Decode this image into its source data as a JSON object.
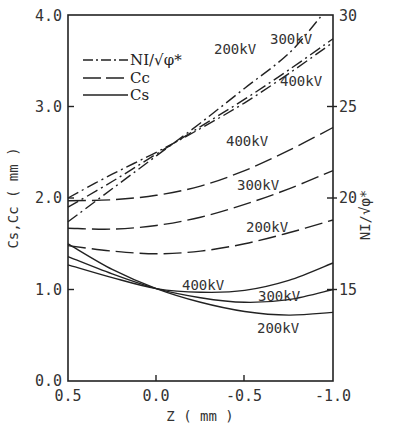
{
  "chart_data": {
    "type": "line",
    "title": "",
    "xlabel": "Z ( mm )",
    "ylabel": "Cs,Cc ( mm )",
    "ylabel_right": "NI/√φ*",
    "xlim": [
      0.5,
      -1.0
    ],
    "ylim": [
      0.0,
      4.0
    ],
    "ylim_right": [
      10,
      30
    ],
    "x_ticks": [
      "0.5",
      "0.0",
      "-0.5",
      "-1.0"
    ],
    "y_ticks": [
      "0.0",
      "1.0",
      "2.0",
      "3.0",
      "4.0"
    ],
    "y_ticks_right": [
      "15",
      "20",
      "25",
      "30"
    ],
    "grid": false,
    "legend": {
      "position": "upper-left",
      "entries": [
        {
          "label": "NI/√φ*",
          "style": "dash-dot"
        },
        {
          "label": "Cc",
          "style": "dashed"
        },
        {
          "label": "Cs",
          "style": "solid"
        }
      ]
    },
    "x": [
      0.5,
      0.25,
      0.0,
      -0.25,
      -0.5,
      -0.75,
      -1.0
    ],
    "series": [
      {
        "name": "NI/√φ* 200kV",
        "axis": "right",
        "style": "dash-dot",
        "x": [
          0.5,
          0.25,
          0.0,
          -0.25,
          -0.5,
          -0.75,
          -0.93
        ],
        "values": [
          18.7,
          20.5,
          22.3,
          24.1,
          26.0,
          27.9,
          29.9
        ]
      },
      {
        "name": "NI/√φ* 300kV",
        "axis": "right",
        "style": "dash-dot",
        "x": [
          0.5,
          0.25,
          0.0,
          -0.25,
          -0.5,
          -0.75,
          -1.0
        ],
        "values": [
          19.5,
          20.9,
          22.4,
          23.9,
          25.4,
          27.0,
          28.7
        ]
      },
      {
        "name": "NI/√φ* 400kV",
        "axis": "right",
        "style": "dash-dot",
        "x": [
          0.5,
          0.25,
          0.0,
          -0.25,
          -0.5,
          -0.75,
          -1.0
        ],
        "values": [
          20.0,
          21.3,
          22.5,
          23.8,
          25.2,
          26.8,
          28.5
        ]
      },
      {
        "name": "Cc 400kV",
        "axis": "left",
        "style": "dashed",
        "values": [
          1.97,
          1.98,
          2.03,
          2.13,
          2.3,
          2.52,
          2.77
        ]
      },
      {
        "name": "Cc 300kV",
        "axis": "left",
        "style": "dashed",
        "values": [
          1.67,
          1.66,
          1.7,
          1.79,
          1.93,
          2.1,
          2.3
        ]
      },
      {
        "name": "Cc 200kV",
        "axis": "left",
        "style": "dashed",
        "values": [
          1.48,
          1.42,
          1.39,
          1.42,
          1.5,
          1.62,
          1.76
        ]
      },
      {
        "name": "Cs 400kV",
        "axis": "left",
        "style": "solid",
        "values": [
          1.27,
          1.13,
          1.01,
          0.97,
          0.99,
          1.1,
          1.29
        ]
      },
      {
        "name": "Cs 300kV",
        "axis": "left",
        "style": "solid",
        "values": [
          1.36,
          1.17,
          1.01,
          0.91,
          0.86,
          0.89,
          1.0
        ]
      },
      {
        "name": "Cs 200kV",
        "axis": "left",
        "style": "solid",
        "values": [
          1.5,
          1.22,
          1.01,
          0.86,
          0.76,
          0.72,
          0.75
        ]
      }
    ],
    "annotations": [
      {
        "text": "200kV",
        "target": "NI/√φ* 200kV"
      },
      {
        "text": "300kV",
        "target": "NI/√φ* 300kV"
      },
      {
        "text": "400kV",
        "target": "NI/√φ* 400kV"
      },
      {
        "text": "400kV",
        "target": "Cc 400kV"
      },
      {
        "text": "300kV",
        "target": "Cc 300kV"
      },
      {
        "text": "200kV",
        "target": "Cc 200kV"
      },
      {
        "text": "400kV",
        "target": "Cs 400kV"
      },
      {
        "text": "300kV",
        "target": "Cs 300kV"
      },
      {
        "text": "200kV",
        "target": "Cs 200kV"
      }
    ]
  },
  "labels": {
    "xlabel": "Z ( mm )",
    "ylabel_left": "Cs,Cc ( mm )",
    "ylabel_right": "NI/√φ*",
    "legend_ni": "NI/√φ*",
    "legend_cc": "Cc",
    "legend_cs": "Cs",
    "x_ticks": [
      "0.5",
      "0.0",
      "-0.5",
      "-1.0"
    ],
    "y_ticks": [
      "0.0",
      "1.0",
      "2.0",
      "3.0",
      "4.0"
    ],
    "y_ticks_right": [
      "15",
      "20",
      "25",
      "30"
    ],
    "curve_labels": {
      "ni_200": "200kV",
      "ni_300": "300kV",
      "ni_400": "400kV",
      "cc_400": "400kV",
      "cc_300": "300kV",
      "cc_200": "200kV",
      "cs_400": "400kV",
      "cs_300": "300kV",
      "cs_200": "200kV"
    }
  }
}
